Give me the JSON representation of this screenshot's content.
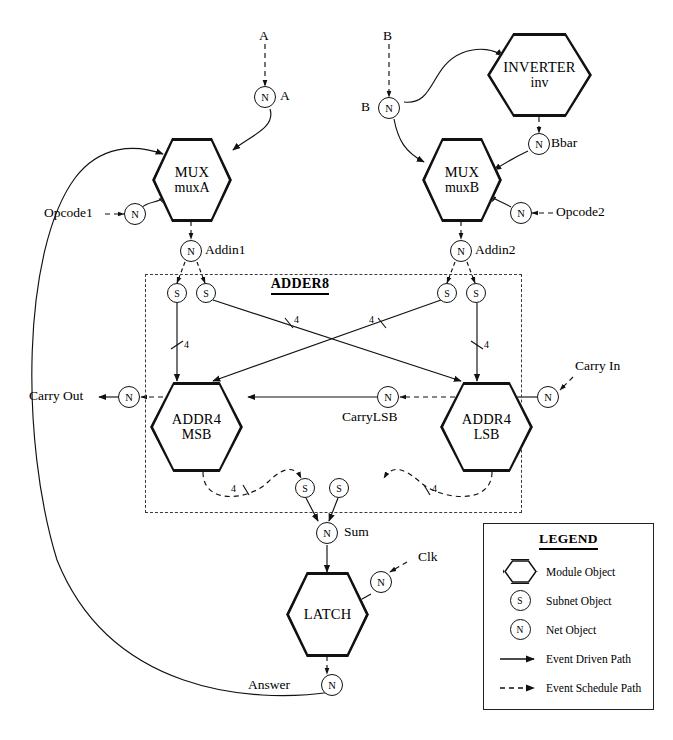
{
  "diagram": {
    "group_box": {
      "title": "ADDER8"
    },
    "modules": [
      {
        "id": "muxA",
        "type": "MUX",
        "instance": "muxA"
      },
      {
        "id": "muxB",
        "type": "MUX",
        "instance": "muxB"
      },
      {
        "id": "inverter",
        "type": "INVERTER",
        "instance": "inv"
      },
      {
        "id": "addr4msb",
        "type": "ADDR4",
        "instance": "MSB"
      },
      {
        "id": "addr4lsb",
        "type": "ADDR4",
        "instance": "LSB"
      },
      {
        "id": "latch",
        "type": "LATCH",
        "instance": ""
      }
    ],
    "nets": [
      {
        "id": "netA",
        "glyph": "N",
        "label": "A"
      },
      {
        "id": "netB",
        "glyph": "N",
        "label": "B"
      },
      {
        "id": "netBbar",
        "glyph": "N",
        "label": "Bbar"
      },
      {
        "id": "netOpcode1",
        "glyph": "N",
        "label": ""
      },
      {
        "id": "netOpcode2",
        "glyph": "N",
        "label": ""
      },
      {
        "id": "netAddin1",
        "glyph": "N",
        "label": "Addin1"
      },
      {
        "id": "netAddin2",
        "glyph": "N",
        "label": "Addin2"
      },
      {
        "id": "netCarryOut",
        "glyph": "N",
        "label": ""
      },
      {
        "id": "netCarryLSB",
        "glyph": "N",
        "label": "CarryLSB"
      },
      {
        "id": "netCarryIn",
        "glyph": "N",
        "label": ""
      },
      {
        "id": "netSum",
        "glyph": "N",
        "label": "Sum"
      },
      {
        "id": "netClk",
        "glyph": "N",
        "label": ""
      },
      {
        "id": "netAnswer",
        "glyph": "N",
        "label": ""
      }
    ],
    "subnets": [
      {
        "id": "s-a1-l",
        "glyph": "S"
      },
      {
        "id": "s-a1-r",
        "glyph": "S"
      },
      {
        "id": "s-a2-l",
        "glyph": "S"
      },
      {
        "id": "s-a2-r",
        "glyph": "S"
      },
      {
        "id": "s-out-l",
        "glyph": "S"
      },
      {
        "id": "s-out-r",
        "glyph": "S"
      }
    ],
    "stimulus_labels": [
      {
        "id": "lbl-A",
        "text": "A"
      },
      {
        "id": "lbl-B",
        "text": "B"
      },
      {
        "id": "lbl-Bside",
        "text": "B"
      },
      {
        "id": "lbl-Aside",
        "text": "A"
      },
      {
        "id": "lbl-opcode1",
        "text": "Opcode1"
      },
      {
        "id": "lbl-opcode2",
        "text": "Opcode2"
      },
      {
        "id": "lbl-bbar",
        "text": "Bbar"
      },
      {
        "id": "lbl-addin1",
        "text": "Addin1"
      },
      {
        "id": "lbl-addin2",
        "text": "Addin2"
      },
      {
        "id": "lbl-carryout",
        "text": "Carry Out"
      },
      {
        "id": "lbl-carryin",
        "text": "Carry In"
      },
      {
        "id": "lbl-carrylsb",
        "text": "CarryLSB"
      },
      {
        "id": "lbl-sum",
        "text": "Sum"
      },
      {
        "id": "lbl-clk",
        "text": "Clk"
      },
      {
        "id": "lbl-answer",
        "text": "Answer"
      }
    ],
    "bus_width_labels": [
      {
        "id": "w-msb-left",
        "text": "4"
      },
      {
        "id": "w-cross-1",
        "text": "4"
      },
      {
        "id": "w-cross-2",
        "text": "4"
      },
      {
        "id": "w-lsb-right",
        "text": "4"
      },
      {
        "id": "w-out-msb",
        "text": "4"
      },
      {
        "id": "w-out-lsb",
        "text": "4"
      }
    ]
  },
  "legend": {
    "title": "LEGEND",
    "items": [
      {
        "symbol": "module-hexagon",
        "glyph": "",
        "text": "Module Object"
      },
      {
        "symbol": "subnet-circle",
        "glyph": "S",
        "text": "Subnet Object"
      },
      {
        "symbol": "net-circle",
        "glyph": "N",
        "text": "Net Object"
      },
      {
        "symbol": "solid-arrow",
        "glyph": "",
        "text": "Event Driven Path"
      },
      {
        "symbol": "dashed-arrow",
        "glyph": "",
        "text": "Event Schedule Path"
      }
    ]
  },
  "colors": {
    "ink": "#000000",
    "dashed_box": "#3b3b3b",
    "background": "#ffffff"
  }
}
